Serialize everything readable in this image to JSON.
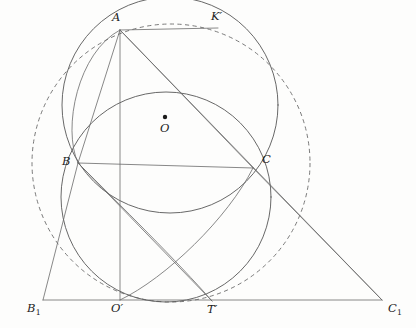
{
  "figure": {
    "type": "geometry-diagram",
    "width": 416,
    "height": 328,
    "background_color": "#fdfdfc",
    "stroke_color": "#575757",
    "dashed_stroke_color": "#6b6b6b",
    "label_color": "#1e1e1e"
  },
  "points": [
    {
      "id": "A",
      "label": "A",
      "x": 120,
      "y": 30,
      "label_x": 112,
      "label_y": 12,
      "sub": "",
      "dot": false
    },
    {
      "id": "K1",
      "label": "K",
      "x": 218,
      "y": 28,
      "label_x": 211,
      "label_y": 11,
      "sub": "",
      "prime": true,
      "dot": false
    },
    {
      "id": "O",
      "label": "O",
      "x": 165,
      "y": 117,
      "label_x": 160,
      "label_y": 123,
      "sub": "",
      "dot": true
    },
    {
      "id": "B",
      "label": "B",
      "x": 78,
      "y": 163,
      "label_x": 62,
      "label_y": 156,
      "sub": "",
      "dot": false
    },
    {
      "id": "C",
      "label": "C",
      "x": 253,
      "y": 168,
      "label_x": 262,
      "label_y": 154,
      "sub": "",
      "dot": false
    },
    {
      "id": "B1",
      "label": "B",
      "x": 43,
      "y": 300,
      "label_x": 27,
      "label_y": 303,
      "sub": "1",
      "dot": false
    },
    {
      "id": "Op",
      "label": "O",
      "x": 120,
      "y": 300,
      "label_x": 111,
      "label_y": 303,
      "sub": "",
      "prime": true,
      "dot": false
    },
    {
      "id": "Tp",
      "label": "T",
      "x": 212,
      "y": 301,
      "label_x": 207,
      "label_y": 304,
      "sub": "",
      "prime": true,
      "dot": false
    },
    {
      "id": "C1",
      "label": "C",
      "x": 382,
      "y": 300,
      "label_x": 388,
      "label_y": 303,
      "sub": "1",
      "dot": false
    }
  ],
  "circles": [
    {
      "id": "dashed-circumcircle",
      "style": "dashed",
      "cx": 171,
      "cy": 163,
      "r": 139
    },
    {
      "id": "upper-circle",
      "style": "solid",
      "cx": 170,
      "cy": 105,
      "r": 108
    },
    {
      "id": "lower-circle",
      "style": "solid",
      "cx": 166,
      "cy": 197,
      "r": 105
    }
  ],
  "arcs": [
    {
      "id": "arc-B-A-left",
      "d": "M 78 163 C 62 128 78 52 120 30"
    },
    {
      "id": "arc-B-Tp-right",
      "d": "M 78 163 C 120 205 178 262 212 301"
    },
    {
      "id": "arc-C-Op",
      "d": "M 253 168 C 228 218 166 278 120 300"
    }
  ],
  "segments": [
    {
      "id": "A-B",
      "x1": 120,
      "y1": 30,
      "x2": 78,
      "y2": 163
    },
    {
      "id": "A-C",
      "x1": 120,
      "y1": 30,
      "x2": 253,
      "y2": 168
    },
    {
      "id": "A-Op",
      "x1": 120,
      "y1": 30,
      "x2": 120,
      "y2": 300
    },
    {
      "id": "A-Kp",
      "x1": 120,
      "y1": 30,
      "x2": 218,
      "y2": 28
    },
    {
      "id": "A-C1",
      "x1": 120,
      "y1": 30,
      "x2": 382,
      "y2": 300
    },
    {
      "id": "B-C",
      "x1": 78,
      "y1": 163,
      "x2": 253,
      "y2": 168
    },
    {
      "id": "B-B1",
      "x1": 78,
      "y1": 163,
      "x2": 43,
      "y2": 300
    },
    {
      "id": "B-Tp",
      "x1": 78,
      "y1": 163,
      "x2": 212,
      "y2": 301
    },
    {
      "id": "B1-C1",
      "x1": 43,
      "y1": 300,
      "x2": 382,
      "y2": 300
    },
    {
      "id": "C-C1",
      "x1": 253,
      "y1": 168,
      "x2": 382,
      "y2": 300
    }
  ]
}
